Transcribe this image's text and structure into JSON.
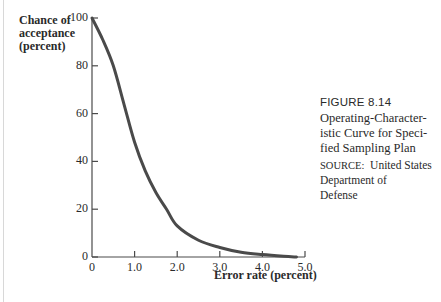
{
  "figure": {
    "number": "FIGURE 8.14",
    "title_lines": [
      "Operating-Character-",
      "istic Curve for Speci-",
      "fied Sampling Plan"
    ],
    "source_label": "SOURCE:",
    "source_lines": [
      "United States",
      "Department of",
      "Defense"
    ]
  },
  "chart_data": {
    "type": "line",
    "xlabel": "Error rate (percent)",
    "ylabel": "Chance of acceptance (percent)",
    "ylabel_lines": [
      "Chance of",
      "acceptance",
      "(percent)"
    ],
    "xlim": [
      0,
      5.0
    ],
    "ylim": [
      0,
      100
    ],
    "x_ticks": [
      "0",
      "1.0",
      "2.0",
      "3.0",
      "4.0",
      "5.0"
    ],
    "y_ticks": [
      "0",
      "20",
      "40",
      "60",
      "80",
      "100"
    ],
    "grid": false,
    "legend": null,
    "series": [
      {
        "name": "OC curve",
        "color": "#4a4a4a",
        "x": [
          0,
          0.25,
          0.5,
          0.75,
          1.0,
          1.25,
          1.5,
          1.75,
          2.0,
          2.5,
          3.0,
          3.5,
          4.0,
          4.5,
          4.8
        ],
        "y": [
          100,
          91,
          80,
          64,
          48,
          36,
          27,
          20,
          13,
          7,
          4,
          2,
          1,
          0.3,
          0
        ]
      }
    ]
  }
}
